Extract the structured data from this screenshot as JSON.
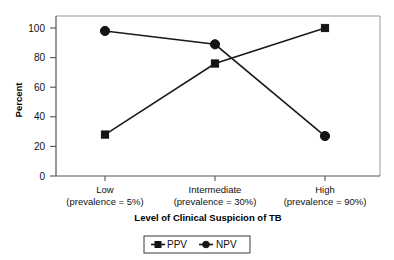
{
  "chart_data": {
    "type": "line",
    "title": "",
    "xlabel": "Level of Clinical Suspicion of TB",
    "ylabel": "Percent",
    "categories": [
      "Low",
      "Intermediate",
      "High"
    ],
    "category_sublabels": [
      "(prevalence = 5%)",
      "(prevalence = 30%)",
      "(prevalence = 90%)"
    ],
    "ylim": [
      0,
      100
    ],
    "yticks": [
      0,
      20,
      40,
      60,
      80,
      100
    ],
    "ytick_labels": [
      "0",
      "20",
      "40",
      "60",
      "80",
      "100"
    ],
    "grid": false,
    "legend_position": "bottom",
    "series": [
      {
        "name": "PPV",
        "marker": "square",
        "color": "#141414",
        "values": [
          28,
          76,
          100
        ]
      },
      {
        "name": "NPV",
        "marker": "circle",
        "color": "#141414",
        "values": [
          98,
          89,
          27
        ]
      }
    ]
  },
  "legend": {
    "items": [
      {
        "label": "PPV",
        "marker": "square-marker-icon"
      },
      {
        "label": "NPV",
        "marker": "circle-marker-icon"
      }
    ]
  },
  "axes": {
    "y_title": "Percent",
    "x_title": "Level of Clinical Suspicion of TB"
  }
}
